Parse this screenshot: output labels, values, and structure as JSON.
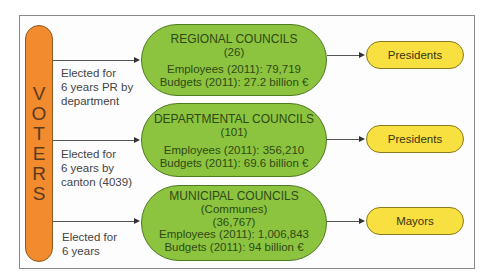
{
  "voters": {
    "label": [
      "V",
      "O",
      "T",
      "E",
      "R",
      "S"
    ]
  },
  "rows": [
    {
      "election": [
        "Elected for",
        "6 years PR by",
        "department"
      ],
      "council": {
        "title": "REGIONAL COUNCILS",
        "count": "(26)",
        "employees": "Employees (2011): 79,719",
        "budgets": "Budgets (2011): 27.2 billion  €"
      },
      "leader": "Presidents"
    },
    {
      "election": [
        "Elected for",
        "6 years by",
        "canton (4039)"
      ],
      "council": {
        "title": "DEPARTMENTAL COUNCILS",
        "count": "(101)",
        "employees": "Employees (2011): 356,210",
        "budgets": "Budgets (2011): 69.6 billion  €"
      },
      "leader": "Presidents"
    },
    {
      "election": [
        "Elected for",
        "6 years"
      ],
      "council": {
        "title": "MUNICIPAL COUNCILS",
        "subtitle": "(Communes)",
        "count": "(36,767)",
        "employees": "Employees (2011): 1,006,843",
        "budgets": "Budgets (2011): 94 billion  €"
      },
      "leader": "Mayors"
    }
  ],
  "colors": {
    "voters": "#f28a2e",
    "council": "#8cc43f",
    "leader": "#f7e040"
  }
}
